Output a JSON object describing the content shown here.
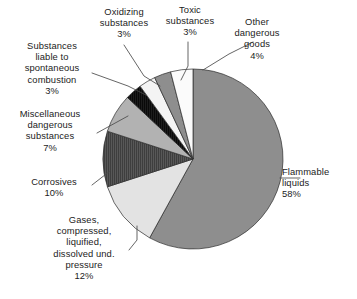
{
  "chart_data": {
    "type": "pie",
    "title": "",
    "subtitle": "",
    "xlabel": "",
    "ylabel": "",
    "grid": false,
    "legend_position": "none",
    "label_format": "name + percent",
    "start_angle_deg": 0,
    "direction": "clockwise",
    "categories": [
      "Flammable liquids",
      "Gases, compressed, liquified, dissolved und. pressure",
      "Corrosives",
      "Miscellaneous dangerous substances",
      "Substances liable to spontaneous combustion",
      "Oxidizing substances",
      "Toxic substances",
      "Other dangerous goods"
    ],
    "values": [
      58,
      12,
      10,
      7,
      3,
      3,
      3,
      4
    ],
    "unit": "%",
    "total": 100,
    "slices": [
      {
        "id": "flammable-liquids",
        "name": "Flammable liquids",
        "value": 58,
        "percent_label": "58%",
        "color": "#8e8e8e",
        "pattern": "solid",
        "label_lines": [
          "Flammable",
          "liquids",
          "58%"
        ]
      },
      {
        "id": "gases-compressed",
        "name": "Gases, compressed, liquified, dissolved und. pressure",
        "value": 12,
        "percent_label": "12%",
        "color": "#e3e3e3",
        "pattern": "solid",
        "label_lines": [
          "Gases,",
          "compressed,",
          "liquified,",
          "dissolved und.",
          "pressure",
          "12%"
        ]
      },
      {
        "id": "corrosives",
        "name": "Corrosives",
        "value": 10,
        "percent_label": "10%",
        "color": "#585858",
        "pattern": "vertical-hatch",
        "label_lines": [
          "Corrosives",
          "10%"
        ]
      },
      {
        "id": "miscellaneous-dangerous-substances",
        "name": "Miscellaneous dangerous substances",
        "value": 7,
        "percent_label": "7%",
        "color": "#b2b2b2",
        "pattern": "solid",
        "label_lines": [
          "Miscellaneous",
          "dangerous",
          "substances",
          "7%"
        ]
      },
      {
        "id": "spontaneous-combustion",
        "name": "Substances liable to spontaneous combustion",
        "value": 3,
        "percent_label": "3%",
        "color": "#1d1d1d",
        "pattern": "vertical-hatch",
        "label_lines": [
          "Substances",
          "liable to",
          "spontaneous",
          "combustion",
          "3%"
        ]
      },
      {
        "id": "oxidizing-substances",
        "name": "Oxidizing substances",
        "value": 3,
        "percent_label": "3%",
        "color": "#f4f4f4",
        "pattern": "solid",
        "label_lines": [
          "Oxidizing",
          "substances",
          "3%"
        ]
      },
      {
        "id": "toxic-substances",
        "name": "Toxic substances",
        "value": 3,
        "percent_label": "3%",
        "color": "#8e8e8e",
        "pattern": "solid",
        "label_lines": [
          "Toxic",
          "substances",
          "3%"
        ]
      },
      {
        "id": "other-dangerous-goods",
        "name": "Other dangerous goods",
        "value": 4,
        "percent_label": "4%",
        "color": "#fbfbfb",
        "pattern": "solid",
        "label_lines": [
          "Other",
          "dangerous",
          "goods",
          "4%"
        ]
      }
    ]
  },
  "labels": {
    "flammable": "Flammable\nliquids\n58%",
    "gases": "Gases,\ncompressed,\nliquified,\ndissolved und.\npressure\n12%",
    "corrosives": "Corrosives\n10%",
    "miscellaneous": "Miscellaneous\ndangerous\nsubstances\n7%",
    "spontaneous": "Substances\nliable to\nspontaneous\ncombustion\n3%",
    "oxidizing": "Oxidizing\nsubstances\n3%",
    "toxic": "Toxic\nsubstances\n3%",
    "other": "Other\ndangerous\ngoods\n4%"
  },
  "style": {
    "background": "#ffffff",
    "text_color": "#1c1c1c",
    "leader_line_color": "#4a4a4a",
    "slice_outline_color": "#2b2b2b"
  }
}
